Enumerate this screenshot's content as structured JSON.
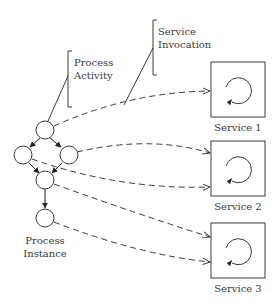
{
  "diagram": {
    "labels": {
      "process_activity": [
        "Process",
        "Activity"
      ],
      "service_invocation": [
        "Service",
        "Invocation"
      ],
      "process_instance": [
        "Process",
        "Instance"
      ]
    },
    "services": [
      {
        "label": "Service 1",
        "icon": "cycle-arrow-icon"
      },
      {
        "label": "Service 2",
        "icon": "cycle-arrow-icon"
      },
      {
        "label": "Service 3",
        "icon": "cycle-arrow-icon"
      }
    ],
    "process_nodes": [
      "top",
      "left",
      "right",
      "middle",
      "bottom"
    ],
    "colors": {
      "stroke": "#3a3a3a",
      "background": "#ffffff"
    }
  }
}
